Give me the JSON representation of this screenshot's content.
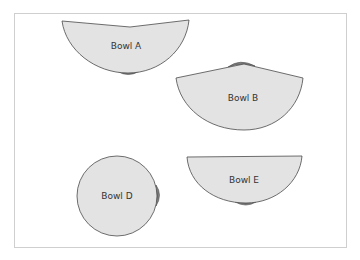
{
  "diagram": {
    "colors": {
      "bowl_fill": "#e3e3e3",
      "bowl_stroke": "#4a4a4a",
      "cap_fill": "#7d7d7d",
      "frame_border": "#cfcfcf",
      "background": "#ffffff"
    },
    "bowls": [
      {
        "id": "A",
        "label": "Bowl A",
        "orientation": "opening up, rim slightly tilted inward, base cap at bottom"
      },
      {
        "id": "B",
        "label": "Bowl B",
        "orientation": "opening down arc, rim peaked upward, base cap on top"
      },
      {
        "id": "D",
        "label": "Bowl D",
        "orientation": "full circle, base cap on right side"
      },
      {
        "id": "E",
        "label": "Bowl E",
        "orientation": "flat rim on top, base cap at bottom"
      }
    ]
  }
}
